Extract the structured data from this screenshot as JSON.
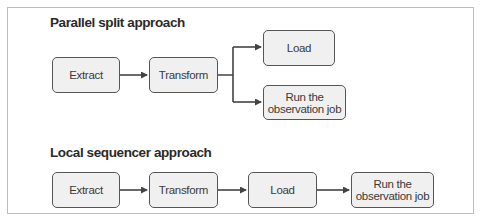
{
  "diagram": {
    "sections": [
      {
        "title": "Parallel split approach",
        "nodes": [
          {
            "id": "extract",
            "label": "Extract"
          },
          {
            "id": "transform",
            "label": "Transform"
          },
          {
            "id": "load",
            "label": "Load"
          },
          {
            "id": "run",
            "label_line1": "Run the",
            "label_line2": "observation job"
          }
        ],
        "edges": [
          {
            "from": "extract",
            "to": "transform"
          },
          {
            "from": "transform",
            "to": "load"
          },
          {
            "from": "transform",
            "to": "run"
          }
        ]
      },
      {
        "title": "Local sequencer approach",
        "nodes": [
          {
            "id": "extract",
            "label": "Extract"
          },
          {
            "id": "transform",
            "label": "Transform"
          },
          {
            "id": "load",
            "label": "Load"
          },
          {
            "id": "run",
            "label_line1": "Run the",
            "label_line2": "observation job"
          }
        ],
        "edges": [
          {
            "from": "extract",
            "to": "transform"
          },
          {
            "from": "transform",
            "to": "load"
          },
          {
            "from": "load",
            "to": "run"
          }
        ]
      }
    ],
    "colors": {
      "node_fill": "#f0f0f0",
      "node_border": "#555555",
      "arrow": "#444444",
      "frame_border": "#bdbdbd"
    }
  }
}
